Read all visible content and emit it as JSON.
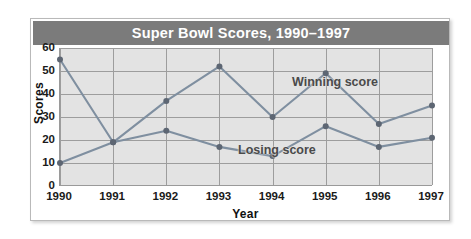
{
  "chart_data": {
    "type": "line",
    "title": "Super Bowl Scores, 1990–1997",
    "xlabel": "Year",
    "ylabel": "Scores",
    "categories": [
      "1990",
      "1991",
      "1992",
      "1993",
      "1994",
      "1995",
      "1996",
      "1997"
    ],
    "series": [
      {
        "name": "Winning score",
        "values": [
          55,
          19,
          37,
          52,
          30,
          49,
          27,
          35
        ],
        "color": "#7f8fa0"
      },
      {
        "name": "Losing score",
        "values": [
          10,
          19,
          24,
          17,
          13,
          26,
          17,
          21
        ],
        "color": "#7f8fa0"
      }
    ],
    "ylim": [
      0,
      60
    ],
    "yticks": [
      0,
      10,
      20,
      30,
      40,
      50,
      60
    ],
    "grid": true,
    "legend_position": "inline-annotations",
    "annotations": [
      {
        "text": "Winning score",
        "series": "Winning score"
      },
      {
        "text": "Losing score",
        "series": "Losing score"
      }
    ]
  },
  "style": {
    "title_bar_color": "#7b7b7b",
    "title_text_color": "#ffffff",
    "plot_background": "#e3e3e3",
    "gridline_color": "#9d9d9d",
    "frame_background": "#ffffff",
    "frame_border_color": "#b9b9b9",
    "marker_color": "#5d6673",
    "annotation_color": "#4a4a4a"
  }
}
